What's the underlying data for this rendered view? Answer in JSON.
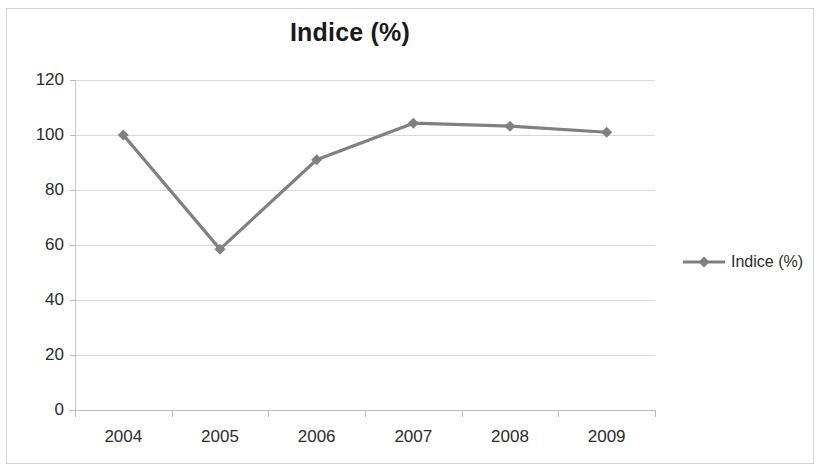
{
  "chart": {
    "title": "Indice (%)",
    "border_color": "#d4d4d4",
    "gridline_color": "#d9d9d9",
    "series_color": "#808080",
    "text_color": "#2b2b2b"
  },
  "legend": {
    "position": "right",
    "entries": [
      {
        "label": "Indice (%)",
        "color": "#808080",
        "marker": "diamond"
      }
    ]
  },
  "chart_data": {
    "type": "line",
    "title": "Indice (%)",
    "xlabel": "",
    "ylabel": "",
    "categories": [
      "2004",
      "2005",
      "2006",
      "2007",
      "2008",
      "2009"
    ],
    "series": [
      {
        "name": "Indice (%)",
        "color": "#808080",
        "marker": "diamond",
        "values": [
          100,
          58.5,
          91,
          104.3,
          103.2,
          101
        ]
      }
    ],
    "ylim": [
      0,
      120
    ],
    "yticks": [
      0,
      20,
      40,
      60,
      80,
      100,
      120
    ],
    "ytick_labels": [
      "0",
      "20",
      "40",
      "60",
      "80",
      "100",
      "120"
    ],
    "grid": true,
    "grid_axis": "y",
    "legend": true,
    "legend_position": "right"
  }
}
